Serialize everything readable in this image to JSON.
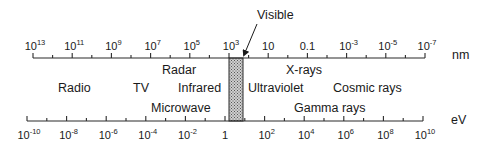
{
  "wavelength_axis": {
    "unit": "nm",
    "ticks": [
      {
        "base": "10",
        "exp": "13"
      },
      {
        "base": "10",
        "exp": "11"
      },
      {
        "base": "10",
        "exp": "9"
      },
      {
        "base": "10",
        "exp": "7"
      },
      {
        "base": "10",
        "exp": "5"
      },
      {
        "base": "10",
        "exp": "3"
      },
      {
        "base": "10",
        "exp": ""
      },
      {
        "base": "0.1",
        "exp": ""
      },
      {
        "base": "10",
        "exp": "-3"
      },
      {
        "base": "10",
        "exp": "-5"
      },
      {
        "base": "10",
        "exp": "-7"
      }
    ]
  },
  "energy_axis": {
    "unit": "eV",
    "ticks": [
      {
        "base": "10",
        "exp": "-10"
      },
      {
        "base": "10",
        "exp": "-8"
      },
      {
        "base": "10",
        "exp": "-6"
      },
      {
        "base": "10",
        "exp": "-4"
      },
      {
        "base": "10",
        "exp": "-2"
      },
      {
        "base": "1",
        "exp": ""
      },
      {
        "base": "10",
        "exp": "2"
      },
      {
        "base": "10",
        "exp": "4"
      },
      {
        "base": "10",
        "exp": "6"
      },
      {
        "base": "10",
        "exp": "8"
      },
      {
        "base": "10",
        "exp": "10"
      }
    ]
  },
  "visible_band": {
    "label": "Visible"
  },
  "regions": [
    {
      "key": "radar",
      "label": "Radar"
    },
    {
      "key": "x-rays",
      "label": "X-rays"
    },
    {
      "key": "radio",
      "label": "Radio"
    },
    {
      "key": "tv",
      "label": "TV"
    },
    {
      "key": "infrared",
      "label": "Infrared"
    },
    {
      "key": "ultraviolet",
      "label": "Ultraviolet"
    },
    {
      "key": "cosmic-rays",
      "label": "Cosmic rays"
    },
    {
      "key": "microwave",
      "label": "Microwave"
    },
    {
      "key": "gamma-rays",
      "label": "Gamma rays"
    }
  ]
}
